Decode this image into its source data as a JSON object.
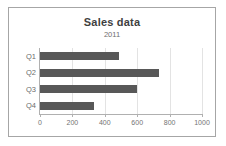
{
  "chart_data": {
    "type": "bar",
    "orientation": "horizontal",
    "title": "Sales data",
    "subtitle": "2011",
    "categories": [
      "Q1",
      "Q2",
      "Q3",
      "Q4"
    ],
    "values": [
      490,
      735,
      600,
      335
    ],
    "series": [
      {
        "name": "Sales",
        "values": [
          490,
          735,
          600,
          335
        ],
        "color": "#585858"
      }
    ],
    "xlabel": "",
    "ylabel": "",
    "xlim": [
      0,
      1000
    ],
    "xticks": [
      0,
      200,
      400,
      600,
      800,
      1000
    ],
    "xtick_labels": [
      "0",
      "200",
      "400",
      "600",
      "800",
      "1000"
    ],
    "grid": "vertical",
    "legend": "none",
    "bar_color": "#585858",
    "gridline_color": "#e3e3e3",
    "axis_color": "#b0b0b0",
    "frame_color": "#a6a6a6",
    "title_color": "#3f3f3f",
    "label_color": "#6b6b6b"
  }
}
